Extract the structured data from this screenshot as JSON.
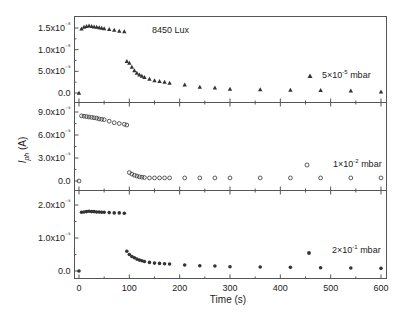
{
  "chart_data": {
    "type": "scatter",
    "layout": "3 vertically stacked panels sharing x-axis",
    "xlabel": "Time (s)",
    "ylabel": "I_ph (A)",
    "xlim": [
      -10,
      610
    ],
    "xticks": [
      0,
      100,
      200,
      300,
      400,
      500,
      600
    ],
    "grid": false,
    "panels": [
      {
        "name": "5x10^-5 mbar",
        "legend_label": "5×10⁻⁵ mbar",
        "annotation": "8450 Lux",
        "marker": "triangle-filled",
        "ylim": [
          -1.5e-09,
          1.75e-08
        ],
        "yticks": [
          0.0,
          5e-09,
          1e-08,
          1.5e-08
        ],
        "ytick_labels": [
          "0.0",
          "5.0x10⁻⁹",
          "1.0x10⁻⁸",
          "1.5x10⁻⁸"
        ],
        "x": [
          0,
          5,
          10,
          15,
          20,
          25,
          30,
          35,
          40,
          45,
          50,
          60,
          70,
          80,
          90,
          95,
          100,
          105,
          110,
          115,
          120,
          125,
          130,
          140,
          150,
          160,
          170,
          180,
          210,
          240,
          270,
          300,
          360,
          420,
          480,
          540,
          600
        ],
        "y": [
          0.0,
          1.48e-08,
          1.52e-08,
          1.54e-08,
          1.55e-08,
          1.54e-08,
          1.53e-08,
          1.52e-08,
          1.51e-08,
          1.5e-08,
          1.49e-08,
          1.47e-08,
          1.45e-08,
          1.43e-08,
          1.42e-08,
          7.3e-09,
          6.9e-09,
          6e-09,
          5.2e-09,
          4.6e-09,
          4.2e-09,
          3.9e-09,
          3.6e-09,
          3.2e-09,
          2.9e-09,
          2.7e-09,
          2.5e-09,
          2.3e-09,
          1.9e-09,
          1.4e-09,
          1.2e-09,
          9e-10,
          8e-10,
          7e-10,
          6e-10,
          5e-10,
          3e-10
        ]
      },
      {
        "name": "1x10^-2 mbar",
        "legend_label": "1×10⁻² mbar",
        "marker": "circle-open",
        "ylim": [
          -9e-10,
          1.05e-08
        ],
        "yticks": [
          0.0,
          3e-09,
          6e-09,
          9e-09
        ],
        "ytick_labels": [
          "0.0",
          "3.0x10⁻⁹",
          "6.0x10⁻⁹",
          "9.0x10⁻⁹"
        ],
        "x": [
          0,
          5,
          10,
          15,
          20,
          25,
          30,
          35,
          40,
          45,
          50,
          60,
          70,
          80,
          90,
          95,
          100,
          105,
          110,
          115,
          120,
          125,
          130,
          140,
          150,
          160,
          170,
          180,
          210,
          240,
          270,
          300,
          360,
          420,
          480,
          540,
          600
        ],
        "y": [
          0.0,
          8.5e-09,
          8.45e-09,
          8.4e-09,
          8.35e-09,
          8.3e-09,
          8.25e-09,
          8.2e-09,
          8.1e-09,
          8.05e-09,
          8e-09,
          7.8e-09,
          7.6e-09,
          7.5e-09,
          7.4e-09,
          7.3e-09,
          1.1e-09,
          9e-10,
          7.5e-10,
          6.5e-10,
          5.5e-10,
          5e-10,
          4.5e-10,
          4e-10,
          4e-10,
          4e-10,
          4e-10,
          4e-10,
          4e-10,
          4e-10,
          4e-10,
          4e-10,
          4e-10,
          4e-10,
          4e-10,
          4e-10,
          4e-10
        ]
      },
      {
        "name": "2x10^-1 mbar",
        "legend_label": "2×10⁻¹ mbar",
        "marker": "star-filled",
        "ylim": [
          -1e-10,
          2.3e-09
        ],
        "yticks": [
          0.0,
          1e-09,
          2e-09
        ],
        "ytick_labels": [
          "0.0",
          "1.0x10⁻⁹",
          "2.0x10⁻⁹"
        ],
        "x": [
          0,
          5,
          10,
          15,
          20,
          25,
          30,
          35,
          40,
          45,
          50,
          60,
          70,
          80,
          90,
          95,
          100,
          105,
          110,
          115,
          120,
          125,
          130,
          140,
          150,
          160,
          170,
          180,
          210,
          240,
          270,
          300,
          360,
          420,
          480,
          540,
          600
        ],
        "y": [
          0.0,
          1.78e-09,
          1.79e-09,
          1.8e-09,
          1.81e-09,
          1.8e-09,
          1.8e-09,
          1.79e-09,
          1.79e-09,
          1.78e-09,
          1.78e-09,
          1.77e-09,
          1.76e-09,
          1.76e-09,
          1.75e-09,
          6e-10,
          5e-10,
          4.4e-10,
          4e-10,
          3.6e-10,
          3.3e-10,
          3.1e-10,
          2.9e-10,
          2.6e-10,
          2.4e-10,
          2.3e-10,
          2.2e-10,
          2.1e-10,
          1.8e-10,
          1.6e-10,
          1.5e-10,
          1.3e-10,
          1.2e-10,
          1.1e-10,
          1e-10,
          9e-11,
          8e-11
        ]
      }
    ]
  },
  "labels": {
    "xlabel": "Time (s)",
    "ylabel_main": "I",
    "ylabel_sub": "ph",
    "ylabel_unit": " (A)",
    "annotation": "8450 Lux",
    "legend": [
      {
        "coef": "5×10",
        "exp": "-5",
        "unit": " mbar"
      },
      {
        "coef": "1×10",
        "exp": "-2",
        "unit": " mbar"
      },
      {
        "coef": "2×10",
        "exp": "-1",
        "unit": " mbar"
      }
    ],
    "xticks": [
      "0",
      "100",
      "200",
      "300",
      "400",
      "500",
      "600"
    ]
  },
  "colors": {
    "frame": "#555555",
    "marker": "#333333",
    "text": "#222222"
  }
}
